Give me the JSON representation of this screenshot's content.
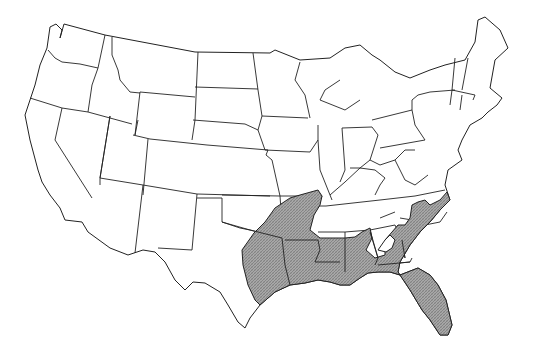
{
  "map": {
    "type": "outline map",
    "region": "Contiguous United States",
    "style": "black state-border outlines on white background",
    "shaded_area": {
      "description": "Shaded (stippled gray) distribution range across the southeastern United States",
      "fill_color": "#9a9a9a",
      "pattern": "fine cross-hatch / stipple",
      "states_covered": [
        "Texas (east)",
        "Oklahoma (southeast corner)",
        "Arkansas",
        "Missouri (southeast bootheel)",
        "Tennessee (southwest)",
        "Louisiana",
        "Mississippi",
        "Alabama",
        "Georgia (south and east)",
        "Florida",
        "South Carolina (coastal)",
        "North Carolina (coastal)"
      ]
    },
    "colors": {
      "background": "#ffffff",
      "outline": "#222222",
      "shading": "#9a9a9a"
    },
    "labels": []
  }
}
